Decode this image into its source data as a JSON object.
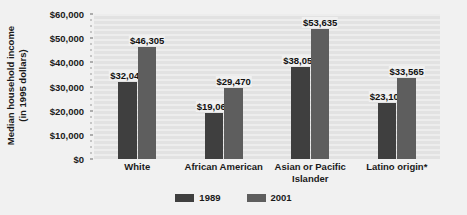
{
  "chart_data": {
    "type": "bar",
    "title": "",
    "subtitle": "",
    "xlabel": "",
    "ylabel": "Median household income\n(in 1995 dollars)",
    "ylabel_line1": "Median household income",
    "ylabel_line2": "(in 1995 dollars)",
    "categories": [
      "White",
      "African American",
      "Asian or Pacific Islander",
      "Latino origin*"
    ],
    "category_lines": [
      [
        "White"
      ],
      [
        "African American"
      ],
      [
        "Asian or Pacific",
        "Islander"
      ],
      [
        "Latino origin*"
      ]
    ],
    "series": [
      {
        "name": "1989",
        "color": "#3f3f3f",
        "values": [
          32049,
          19060,
          38053,
          23105
        ],
        "labels": [
          "$32,049",
          "$19,060",
          "$38,053",
          "$23,105"
        ]
      },
      {
        "name": "2001",
        "color": "#5e5e5e",
        "values": [
          46305,
          29470,
          53635,
          33565
        ],
        "labels": [
          "$46,305",
          "$29,470",
          "$53,635",
          "$33,565"
        ]
      }
    ],
    "ylim": [
      0,
      60000
    ],
    "ytick_values": [
      0,
      10000,
      20000,
      30000,
      40000,
      50000,
      60000
    ],
    "ytick_labels": [
      "$0",
      "$10,000",
      "$20,000",
      "$30,000",
      "$40,000",
      "$50,000",
      "$60,000"
    ],
    "grid": true,
    "grid_orientation": "horizontal",
    "legend_position": "bottom-center",
    "plot_background": "#e9e9e9",
    "card_background": "#f1f1f1"
  },
  "legend": {
    "items": [
      {
        "label": "1989",
        "color": "#3f3f3f"
      },
      {
        "label": "2001",
        "color": "#5e5e5e"
      }
    ]
  }
}
